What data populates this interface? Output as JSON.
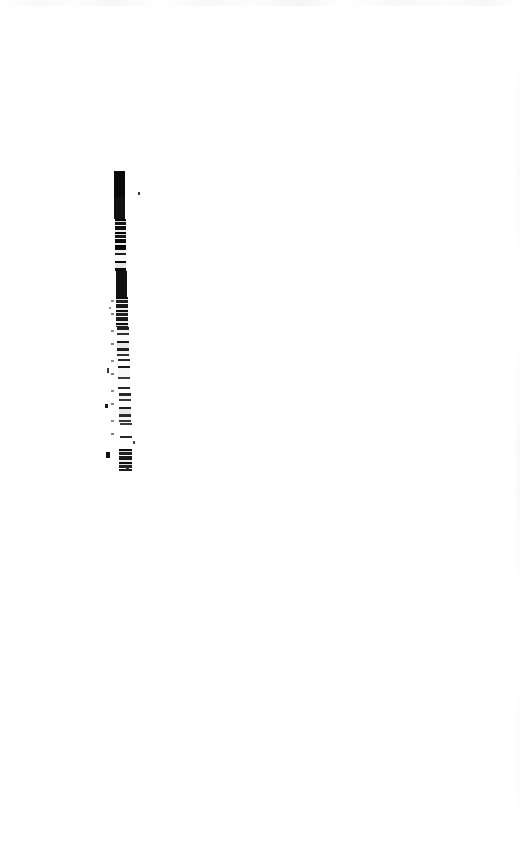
{
  "document": {
    "kind": "scanned-page",
    "page_width": 520,
    "page_height": 862,
    "background_color": "#ffffff",
    "ink_color": "#0a0a0a",
    "visible_text": "",
    "note": "No legible text is rendered in the pixels; page is blank apart from one dark vertical scan streak."
  },
  "artifact": {
    "name": "vertical-scan-streak",
    "description": "Single narrow near-vertical black streak, dense at top and degrading into broken speckle toward the bottom.",
    "x_left": 112,
    "x_right": 131,
    "y_top": 171,
    "y_bottom": 471,
    "segments": [
      {
        "id": "solid-head",
        "y": 171,
        "height": 26,
        "x": 114,
        "width": 11,
        "tone": "#0a0a0a"
      },
      {
        "id": "dense-upper",
        "y": 197,
        "height": 22,
        "x": 114,
        "width": 11,
        "tone": "#111111"
      },
      {
        "id": "dense-mid",
        "y": 219,
        "height": 28,
        "x": 115,
        "width": 11,
        "tone": "#0d0d0d"
      },
      {
        "id": "break-1",
        "y": 247,
        "height": 24,
        "x": 115,
        "width": 11,
        "tone": "#141414"
      },
      {
        "id": "dense-lower",
        "y": 271,
        "height": 26,
        "x": 116,
        "width": 11,
        "tone": "#101010"
      },
      {
        "id": "fade-1",
        "y": 297,
        "height": 30,
        "x": 116,
        "width": 12,
        "tone": "#1a1a1a"
      },
      {
        "id": "fade-2",
        "y": 327,
        "height": 32,
        "x": 117,
        "width": 12,
        "tone": "#1f1f1f"
      },
      {
        "id": "speckle-1",
        "y": 359,
        "height": 34,
        "x": 118,
        "width": 12,
        "tone": "#222222"
      },
      {
        "id": "speckle-2",
        "y": 393,
        "height": 30,
        "x": 119,
        "width": 12,
        "tone": "#262626"
      },
      {
        "id": "speckle-3",
        "y": 423,
        "height": 26,
        "x": 120,
        "width": 12,
        "tone": "#2a2a2a"
      },
      {
        "id": "tail",
        "y": 449,
        "height": 22,
        "x": 119,
        "width": 13,
        "tone": "#1c1c1c"
      }
    ],
    "flecks": [
      {
        "id": "fleck-right-upper",
        "x": 138,
        "y": 192,
        "width": 2,
        "height": 3,
        "tone": "#3a3a3a"
      },
      {
        "id": "fleck-left-mid",
        "x": 109,
        "y": 307,
        "width": 2,
        "height": 2,
        "tone": "#8a8a8a"
      },
      {
        "id": "fleck-left-lower",
        "x": 107,
        "y": 368,
        "width": 2,
        "height": 5,
        "tone": "#3a3a3a"
      },
      {
        "id": "fleck-left-tail",
        "x": 105,
        "y": 404,
        "width": 3,
        "height": 4,
        "tone": "#1a1a1a"
      },
      {
        "id": "fleck-left-end",
        "x": 106,
        "y": 452,
        "width": 4,
        "height": 6,
        "tone": "#111111"
      },
      {
        "id": "fleck-right-tail",
        "x": 133,
        "y": 441,
        "width": 2,
        "height": 3,
        "tone": "#4a4a4a"
      },
      {
        "id": "fleck-below-tail",
        "x": 126,
        "y": 467,
        "width": 3,
        "height": 3,
        "tone": "#2b2b2b"
      }
    ]
  },
  "margins": {
    "top_blank_height": 171,
    "bottom_blank_start": 471,
    "left_blank_width": 112,
    "right_blank_start": 131
  }
}
